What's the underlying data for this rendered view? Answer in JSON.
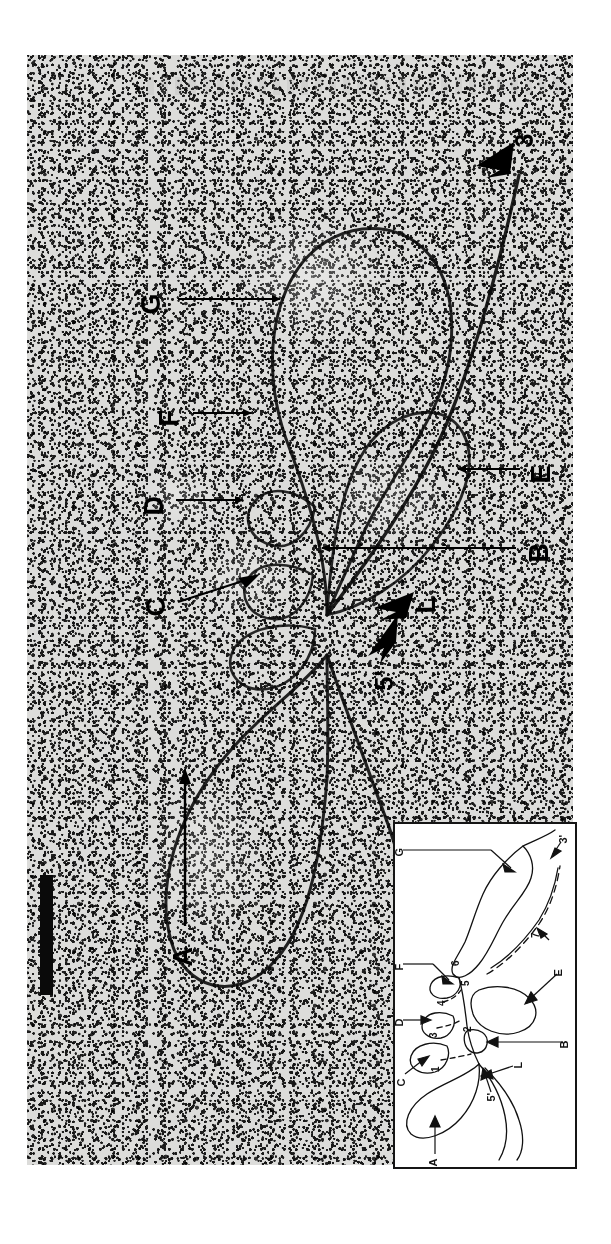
{
  "figure": {
    "type": "electron-micrograph",
    "orientation_note": "image content rotated 90 degrees counter-clockwise",
    "has_scale_bar": true
  },
  "micrograph": {
    "labels": [
      {
        "id": "label-3prime",
        "text": "3'",
        "marker": "solid-arrowhead",
        "x": 520,
        "y": 140
      },
      {
        "id": "label-G",
        "text": "G",
        "marker": "line-arrow",
        "x": 150,
        "y": 300
      },
      {
        "id": "label-F",
        "text": "F",
        "marker": "line-arrow",
        "x": 170,
        "y": 412
      },
      {
        "id": "label-E",
        "text": "E",
        "marker": "line-arrow",
        "x": 540,
        "y": 470
      },
      {
        "id": "label-D",
        "text": "D",
        "marker": "line-arrow",
        "x": 152,
        "y": 500
      },
      {
        "id": "label-B",
        "text": "B",
        "marker": "line-arrow",
        "x": 538,
        "y": 548
      },
      {
        "id": "label-C",
        "text": "C",
        "marker": "line-arrow",
        "x": 155,
        "y": 600
      },
      {
        "id": "label-L",
        "text": "L",
        "marker": "solid-arrowhead",
        "x": 425,
        "y": 598
      },
      {
        "id": "label-5prime",
        "text": "5'",
        "marker": "solid-arrowhead",
        "x": 382,
        "y": 680
      },
      {
        "id": "label-A",
        "text": "A",
        "marker": "long-line-arrow",
        "x": 182,
        "y": 952
      }
    ]
  },
  "inset": {
    "title": "interpretive-schematic",
    "letter_labels": [
      {
        "id": "inset-label-G",
        "text": "G"
      },
      {
        "id": "inset-label-F",
        "text": "F"
      },
      {
        "id": "inset-label-D",
        "text": "D"
      },
      {
        "id": "inset-label-C",
        "text": "C"
      },
      {
        "id": "inset-label-A",
        "text": "A"
      },
      {
        "id": "inset-label-E",
        "text": "E"
      },
      {
        "id": "inset-label-B",
        "text": "B"
      },
      {
        "id": "inset-label-L",
        "text": "L"
      },
      {
        "id": "inset-label-3prime",
        "text": "3'"
      },
      {
        "id": "inset-label-5prime",
        "text": "5'"
      }
    ],
    "segment_numbers": [
      {
        "id": "inset-num-1",
        "text": "1"
      },
      {
        "id": "inset-num-2",
        "text": "2"
      },
      {
        "id": "inset-num-3",
        "text": "3"
      },
      {
        "id": "inset-num-4",
        "text": "4"
      },
      {
        "id": "inset-num-5",
        "text": "5"
      },
      {
        "id": "inset-num-6",
        "text": "6"
      },
      {
        "id": "inset-num-7",
        "text": "7"
      }
    ]
  }
}
